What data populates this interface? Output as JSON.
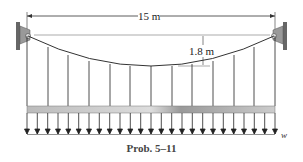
{
  "diagram": {
    "span_label": "15 m",
    "sag_label": "1.8 m",
    "load_label": "w",
    "caption": "Prob. 5–11",
    "hanger_count": 13,
    "arrow_count": 25
  }
}
